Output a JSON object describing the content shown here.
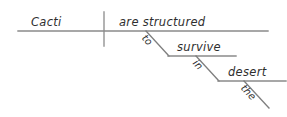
{
  "diagram": {
    "type": "reed-kellogg-sentence-diagram",
    "sentence": "Cacti are structured to survive in the desert.",
    "colors": {
      "background": "#ffffff",
      "line": "#8a8a8a",
      "text": "#2e2e2e"
    },
    "baselines": [
      {
        "name": "main-baseline",
        "x1": 18,
        "y1": 31,
        "x2": 268,
        "y2": 31
      },
      {
        "name": "survive-baseline",
        "x1": 168,
        "y1": 56,
        "x2": 236,
        "y2": 56
      },
      {
        "name": "desert-baseline",
        "x1": 218,
        "y1": 81,
        "x2": 286,
        "y2": 81
      }
    ],
    "divider": {
      "name": "subject-predicate-divider",
      "x1": 104,
      "y1": 12,
      "x2": 104,
      "y2": 46
    },
    "diagonals": [
      {
        "name": "to-diagonal",
        "x1": 146,
        "y1": 31,
        "x2": 169,
        "y2": 56
      },
      {
        "name": "in-diagonal",
        "x1": 196,
        "y1": 56,
        "x2": 219,
        "y2": 81
      },
      {
        "name": "the-diagonal",
        "x1": 244,
        "y1": 81,
        "x2": 269,
        "y2": 108
      }
    ],
    "words": {
      "subject": "Cacti",
      "verb": "are structured",
      "infinitive": "to",
      "infinitive_verb": "survive",
      "preposition": "in",
      "object_of_preposition": "desert",
      "article": "the"
    }
  }
}
